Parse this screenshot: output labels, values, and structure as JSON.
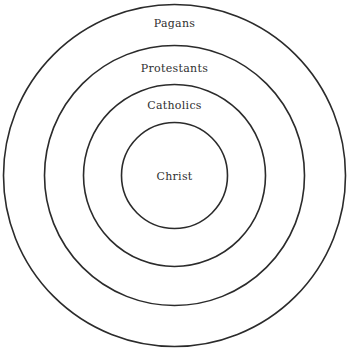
{
  "diagram": {
    "type": "concentric-circles",
    "center": {
      "x": 174.5,
      "y": 175.5
    },
    "stroke_color": "#2b2b2b",
    "rings": [
      {
        "label": "Pagans",
        "radius": 171,
        "label_y": 27
      },
      {
        "label": "Protestants",
        "radius": 130,
        "label_y": 72
      },
      {
        "label": "Catholics",
        "radius": 91,
        "label_y": 109
      },
      {
        "label": "Christ",
        "radius": 53,
        "label_y": 180
      }
    ]
  }
}
